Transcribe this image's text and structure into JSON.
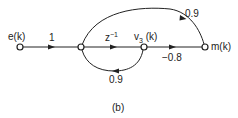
{
  "figure": {
    "caption": "(b)",
    "nodes": [
      {
        "id": "e",
        "label": "e(k)"
      },
      {
        "id": "n2",
        "label": ""
      },
      {
        "id": "v3",
        "label": "v",
        "subscript": "3",
        "suffix": " (k)"
      },
      {
        "id": "m",
        "label": "m(k)"
      }
    ],
    "branches": [
      {
        "from": "e",
        "to": "n2",
        "gain": "1"
      },
      {
        "from": "n2",
        "to": "v3",
        "gain_base": "z",
        "gain_exp": "−1"
      },
      {
        "from": "v3",
        "to": "m",
        "gain": "−0.8"
      },
      {
        "from": "n2",
        "to": "m",
        "gain": "0.9"
      },
      {
        "from": "v3",
        "to": "n2",
        "gain": "0.9"
      }
    ]
  },
  "colors": {
    "line": "#222222",
    "background": "#ffffff"
  }
}
